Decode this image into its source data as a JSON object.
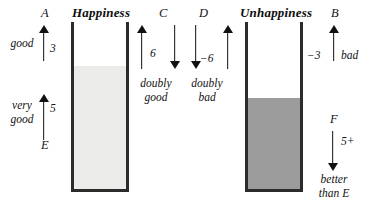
{
  "figure": {
    "type": "conceptual-diagram"
  },
  "vessels": [
    {
      "id": "happiness",
      "title": "Happiness",
      "fill_color": "#ebebe9",
      "border_color": "#2b2b2b"
    },
    {
      "id": "unhappiness",
      "title": "Unhappiness",
      "fill_color": "#9c9c9c",
      "border_color": "#2b2b2b"
    }
  ],
  "annotations": {
    "a": {
      "point": "A",
      "value": "3",
      "word": "good",
      "direction": "up"
    },
    "e": {
      "point": "E",
      "value": "5",
      "word": "very\ngood",
      "word_line1": "very",
      "word_line2": "good",
      "direction": "up"
    },
    "c": {
      "point": "C",
      "value": "6",
      "word_line1": "doubly",
      "word_line2": "good",
      "direction_left": "up",
      "direction_right": "down"
    },
    "d": {
      "point": "D",
      "value": "−6",
      "word_line1": "doubly",
      "word_line2": "bad",
      "direction_left": "down",
      "direction_right": "up"
    },
    "b": {
      "point": "B",
      "value": "−3",
      "word": "bad",
      "direction": "up"
    },
    "f": {
      "point": "F",
      "value": "5+",
      "word_line1": "better",
      "word_line2": "than E",
      "direction": "down"
    }
  }
}
